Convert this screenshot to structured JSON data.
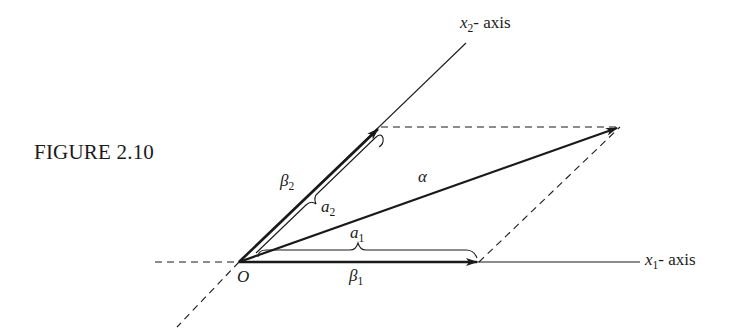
{
  "figure": {
    "caption": "FIGURE 2.10"
  },
  "axes": {
    "x1": {
      "var": "x",
      "sub": "1",
      "suffix": "- axis"
    },
    "x2": {
      "var": "x",
      "sub": "2",
      "suffix": "- axis"
    }
  },
  "points": {
    "origin": "O"
  },
  "vectors": {
    "beta1": {
      "sym": "β",
      "sub": "1"
    },
    "beta2": {
      "sym": "β",
      "sub": "2"
    },
    "alpha": {
      "sym": "α"
    }
  },
  "components": {
    "a1": {
      "sym": "a",
      "sub": "1"
    },
    "a2": {
      "sym": "a",
      "sub": "2"
    }
  },
  "colors": {
    "ink": "#1a1a1a",
    "background": "#ffffff"
  }
}
